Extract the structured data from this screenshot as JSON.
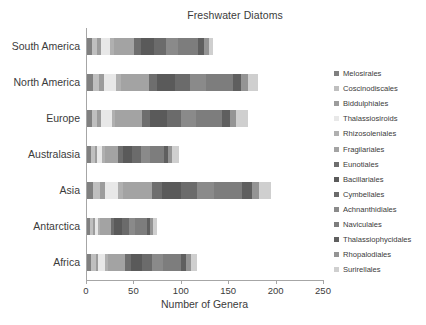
{
  "chart_data": {
    "type": "bar",
    "orientation": "horizontal",
    "stacked": true,
    "title": "Freshwater Diatoms",
    "xlabel": "Number of Genera",
    "ylabel": "",
    "xlim": [
      0,
      250
    ],
    "xticks": [
      0,
      50,
      100,
      150,
      200,
      250
    ],
    "grid": false,
    "legend_position": "right",
    "categories": [
      "South America",
      "North America",
      "Europe",
      "Australasia",
      "Asia",
      "Antarctica",
      "Africa"
    ],
    "totals": [
      133,
      180,
      170,
      97,
      194,
      74,
      116
    ],
    "series": [
      {
        "name": "Melosirales",
        "color": "#808080",
        "values": [
          5,
          6,
          5,
          4,
          6,
          3,
          4
        ]
      },
      {
        "name": "Coscinodiscales",
        "color": "#bfbfbf",
        "values": [
          6,
          7,
          6,
          4,
          8,
          3,
          5
        ]
      },
      {
        "name": "Biddulphiales",
        "color": "#9c9c9c",
        "values": [
          4,
          5,
          4,
          3,
          5,
          2,
          3
        ]
      },
      {
        "name": "Thalassiosiroids",
        "color": "#e8e8e8",
        "values": [
          9,
          13,
          11,
          5,
          14,
          4,
          7
        ]
      },
      {
        "name": "Rhizosoleniales",
        "color": "#b0b0b0",
        "values": [
          4,
          5,
          4,
          3,
          5,
          2,
          3
        ]
      },
      {
        "name": "Fragilariales",
        "color": "#a3a3a3",
        "values": [
          22,
          29,
          28,
          14,
          31,
          11,
          18
        ]
      },
      {
        "name": "Eunotiales",
        "color": "#6e6e6e",
        "values": [
          7,
          9,
          8,
          5,
          10,
          4,
          6
        ]
      },
      {
        "name": "Bacillariales",
        "color": "#5a5a5a",
        "values": [
          14,
          19,
          18,
          10,
          20,
          8,
          12
        ]
      },
      {
        "name": "Cymbellales",
        "color": "#6b6b6b",
        "values": [
          12,
          16,
          15,
          9,
          17,
          7,
          11
        ]
      },
      {
        "name": "Achnanthidiales",
        "color": "#8a8a8a",
        "values": [
          13,
          17,
          16,
          9,
          18,
          7,
          11
        ]
      },
      {
        "name": "Naviculales",
        "color": "#7d7d7d",
        "values": [
          21,
          28,
          27,
          15,
          30,
          12,
          19
        ]
      },
      {
        "name": "Thalassiophycidales",
        "color": "#5f5f5f",
        "values": [
          7,
          9,
          9,
          5,
          10,
          4,
          6
        ]
      },
      {
        "name": "Rhopalodiales",
        "color": "#949494",
        "values": [
          5,
          7,
          6,
          4,
          8,
          3,
          5
        ]
      },
      {
        "name": "Surirellales",
        "color": "#cfcfcf",
        "values": [
          4,
          10,
          13,
          7,
          12,
          4,
          6
        ]
      }
    ]
  },
  "axis": {
    "tick_labels": [
      "0",
      "50",
      "100",
      "150",
      "200",
      "250"
    ]
  },
  "colors": {
    "axis_line": "#a6a6a6",
    "text": "#3b3b3b",
    "background": "#ffffff"
  }
}
